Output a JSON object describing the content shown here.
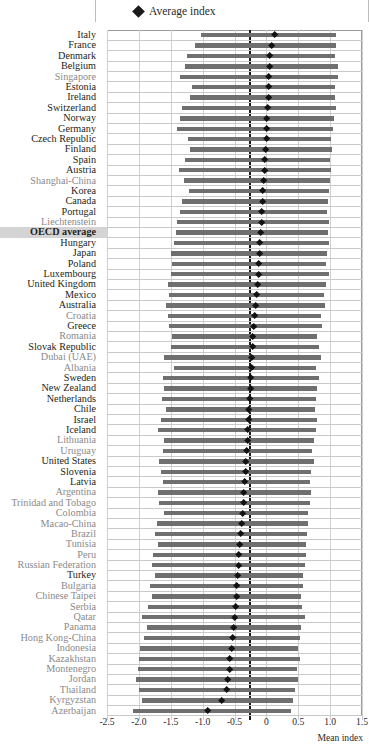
{
  "legend": {
    "marker_icon": "diamond-marker",
    "label": "Average index"
  },
  "axis": {
    "title": "Mean index",
    "ticks": [
      "-2.5",
      "-2.0",
      "-1.5",
      "-1.0",
      "-0.5",
      "0",
      "0.5",
      "1.0",
      "1.5"
    ],
    "tick_values": [
      -2.5,
      -2.0,
      -1.5,
      -1.0,
      -0.5,
      0,
      0.5,
      1.0,
      1.5
    ],
    "min": -2.5,
    "max": 1.5
  },
  "colors": {
    "bar": "#6f6f6f",
    "marker": "#111111",
    "grid": "#d0d0d0",
    "frame": "#9a9a9a",
    "reference_line": "#1a1a1a",
    "oecd_label": "#231f20",
    "partner_label": "#8a8a8a",
    "highlight_bg": "#d4d4d4"
  },
  "reference_line_value": -0.27,
  "chart_data": {
    "type": "bar",
    "title": "",
    "subtitle": "",
    "xlabel": "Mean index",
    "ylabel": "",
    "xlim": [
      -2.5,
      1.5
    ],
    "grid": true,
    "legend_position": "top",
    "series": [
      {
        "name": "Range (bottom quarter to top quarter)",
        "type": "range-bar"
      },
      {
        "name": "Average index",
        "type": "diamond-marker"
      }
    ],
    "categories": [
      "Italy",
      "France",
      "Denmark",
      "Belgium",
      "Singapore",
      "Estonia",
      "Ireland",
      "Switzerland",
      "Norway",
      "Germany",
      "Czech Republic",
      "Finland",
      "Spain",
      "Austria",
      "Shanghai-China",
      "Korea",
      "Canada",
      "Portugal",
      "Liechtenstein",
      "OECD average",
      "Hungary",
      "Japan",
      "Poland",
      "Luxembourg",
      "United Kingdom",
      "Mexico",
      "Australia",
      "Croatia",
      "Greece",
      "Romania",
      "Slovak Republic",
      "Dubai (UAE)",
      "Albania",
      "Sweden",
      "New Zealand",
      "Netherlands",
      "Chile",
      "Israel",
      "Iceland",
      "Lithuania",
      "Uruguay",
      "United States",
      "Slovenia",
      "Latvia",
      "Argentina",
      "Trinidad and Tobago",
      "Colombia",
      "Macao-China",
      "Brazil",
      "Tunisia",
      "Peru",
      "Russian Federation",
      "Turkey",
      "Bulgaria",
      "Chinese Taipei",
      "Serbia",
      "Qatar",
      "Panama",
      "Hong Kong-China",
      "Indonesia",
      "Kazakhstan",
      "Montenegro",
      "Jordan",
      "Thailand",
      "Kyrgyzstan",
      "Azerbaijan"
    ],
    "rows": [
      {
        "label": "Italy",
        "partner": false,
        "highlight": false,
        "low": -1.02,
        "high": 1.1,
        "avg": 0.13
      },
      {
        "label": "France",
        "partner": false,
        "highlight": false,
        "low": -1.12,
        "high": 1.1,
        "avg": 0.09
      },
      {
        "label": "Denmark",
        "partner": false,
        "highlight": false,
        "low": -1.25,
        "high": 1.08,
        "avg": 0.05
      },
      {
        "label": "Belgium",
        "partner": false,
        "highlight": false,
        "low": -1.28,
        "high": 1.12,
        "avg": 0.05
      },
      {
        "label": "Singapore",
        "partner": true,
        "highlight": false,
        "low": -1.35,
        "high": 1.12,
        "avg": 0.04
      },
      {
        "label": "Estonia",
        "partner": false,
        "highlight": false,
        "low": -1.16,
        "high": 1.07,
        "avg": 0.03
      },
      {
        "label": "Ireland",
        "partner": false,
        "highlight": false,
        "low": -1.2,
        "high": 1.08,
        "avg": 0.03
      },
      {
        "label": "Switzerland",
        "partner": false,
        "highlight": false,
        "low": -1.33,
        "high": 1.09,
        "avg": 0.02
      },
      {
        "label": "Norway",
        "partner": false,
        "highlight": false,
        "low": -1.35,
        "high": 1.06,
        "avg": 0.01
      },
      {
        "label": "Germany",
        "partner": false,
        "highlight": false,
        "low": -1.4,
        "high": 1.04,
        "avg": 0.0
      },
      {
        "label": "Czech Republic",
        "partner": false,
        "highlight": false,
        "low": -1.23,
        "high": 1.02,
        "avg": 0.0
      },
      {
        "label": "Finland",
        "partner": false,
        "highlight": false,
        "low": -1.2,
        "high": 1.03,
        "avg": -0.01
      },
      {
        "label": "Spain",
        "partner": false,
        "highlight": false,
        "low": -1.28,
        "high": 1.0,
        "avg": -0.02
      },
      {
        "label": "Austria",
        "partner": false,
        "highlight": false,
        "low": -1.37,
        "high": 1.02,
        "avg": -0.03
      },
      {
        "label": "Shanghai-China",
        "partner": true,
        "highlight": false,
        "low": -1.3,
        "high": 1.0,
        "avg": -0.04
      },
      {
        "label": "Korea",
        "partner": false,
        "highlight": false,
        "low": -1.22,
        "high": 0.98,
        "avg": -0.05
      },
      {
        "label": "Canada",
        "partner": false,
        "highlight": false,
        "low": -1.33,
        "high": 0.96,
        "avg": -0.06
      },
      {
        "label": "Portugal",
        "partner": false,
        "highlight": false,
        "low": -1.35,
        "high": 0.95,
        "avg": -0.07
      },
      {
        "label": "Liechtenstein",
        "partner": true,
        "highlight": false,
        "low": -1.4,
        "high": 0.98,
        "avg": -0.08
      },
      {
        "label": "OECD average",
        "partner": false,
        "highlight": true,
        "low": -1.42,
        "high": 0.96,
        "avg": -0.09
      },
      {
        "label": "Hungary",
        "partner": false,
        "highlight": false,
        "low": -1.45,
        "high": 0.98,
        "avg": -0.1
      },
      {
        "label": "Japan",
        "partner": false,
        "highlight": false,
        "low": -1.5,
        "high": 0.95,
        "avg": -0.11
      },
      {
        "label": "Poland",
        "partner": false,
        "highlight": false,
        "low": -1.48,
        "high": 0.93,
        "avg": -0.12
      },
      {
        "label": "Luxembourg",
        "partner": false,
        "highlight": false,
        "low": -1.5,
        "high": 0.99,
        "avg": -0.12
      },
      {
        "label": "United Kingdom",
        "partner": false,
        "highlight": false,
        "low": -1.55,
        "high": 0.93,
        "avg": -0.14
      },
      {
        "label": "Mexico",
        "partner": false,
        "highlight": false,
        "low": -1.53,
        "high": 0.9,
        "avg": -0.15
      },
      {
        "label": "Australia",
        "partner": false,
        "highlight": false,
        "low": -1.58,
        "high": 0.92,
        "avg": -0.17
      },
      {
        "label": "Croatia",
        "partner": true,
        "highlight": false,
        "low": -1.55,
        "high": 0.85,
        "avg": -0.19
      },
      {
        "label": "Greece",
        "partner": false,
        "highlight": false,
        "low": -1.53,
        "high": 0.88,
        "avg": -0.2
      },
      {
        "label": "Romania",
        "partner": true,
        "highlight": false,
        "low": -1.48,
        "high": 0.8,
        "avg": -0.21
      },
      {
        "label": "Slovak Republic",
        "partner": false,
        "highlight": false,
        "low": -1.5,
        "high": 0.82,
        "avg": -0.22
      },
      {
        "label": "Dubai (UAE)",
        "partner": true,
        "highlight": false,
        "low": -1.6,
        "high": 0.85,
        "avg": -0.23
      },
      {
        "label": "Albania",
        "partner": true,
        "highlight": false,
        "low": -1.45,
        "high": 0.78,
        "avg": -0.23
      },
      {
        "label": "Sweden",
        "partner": false,
        "highlight": false,
        "low": -1.62,
        "high": 0.82,
        "avg": -0.24
      },
      {
        "label": "New Zealand",
        "partner": false,
        "highlight": false,
        "low": -1.6,
        "high": 0.8,
        "avg": -0.25
      },
      {
        "label": "Netherlands",
        "partner": false,
        "highlight": false,
        "low": -1.63,
        "high": 0.78,
        "avg": -0.26
      },
      {
        "label": "Chile",
        "partner": false,
        "highlight": false,
        "low": -1.58,
        "high": 0.76,
        "avg": -0.27
      },
      {
        "label": "Israel",
        "partner": false,
        "highlight": false,
        "low": -1.65,
        "high": 0.8,
        "avg": -0.28
      },
      {
        "label": "Iceland",
        "partner": false,
        "highlight": false,
        "low": -1.7,
        "high": 0.78,
        "avg": -0.29
      },
      {
        "label": "Lithuania",
        "partner": true,
        "highlight": false,
        "low": -1.6,
        "high": 0.74,
        "avg": -0.3
      },
      {
        "label": "Uruguay",
        "partner": true,
        "highlight": false,
        "low": -1.62,
        "high": 0.72,
        "avg": -0.31
      },
      {
        "label": "United States",
        "partner": false,
        "highlight": false,
        "low": -1.68,
        "high": 0.74,
        "avg": -0.32
      },
      {
        "label": "Slovenia",
        "partner": false,
        "highlight": false,
        "low": -1.65,
        "high": 0.7,
        "avg": -0.33
      },
      {
        "label": "Latvia",
        "partner": false,
        "highlight": false,
        "low": -1.62,
        "high": 0.68,
        "avg": -0.34
      },
      {
        "label": "Argentina",
        "partner": true,
        "highlight": false,
        "low": -1.7,
        "high": 0.7,
        "avg": -0.35
      },
      {
        "label": "Trinidad and Tobago",
        "partner": true,
        "highlight": false,
        "low": -1.68,
        "high": 0.68,
        "avg": -0.36
      },
      {
        "label": "Colombia",
        "partner": true,
        "highlight": false,
        "low": -1.6,
        "high": 0.65,
        "avg": -0.37
      },
      {
        "label": "Macao-China",
        "partner": true,
        "highlight": false,
        "low": -1.72,
        "high": 0.66,
        "avg": -0.38
      },
      {
        "label": "Brazil",
        "partner": true,
        "highlight": false,
        "low": -1.75,
        "high": 0.64,
        "avg": -0.41
      },
      {
        "label": "Tunisia",
        "partner": true,
        "highlight": false,
        "low": -1.7,
        "high": 0.62,
        "avg": -0.42
      },
      {
        "label": "Peru",
        "partner": true,
        "highlight": false,
        "low": -1.78,
        "high": 0.62,
        "avg": -0.43
      },
      {
        "label": "Russian Federation",
        "partner": true,
        "highlight": false,
        "low": -1.8,
        "high": 0.6,
        "avg": -0.44
      },
      {
        "label": "Turkey",
        "partner": false,
        "highlight": false,
        "low": -1.75,
        "high": 0.58,
        "avg": -0.45
      },
      {
        "label": "Bulgaria",
        "partner": true,
        "highlight": false,
        "low": -1.82,
        "high": 0.58,
        "avg": -0.46
      },
      {
        "label": "Chinese Taipei",
        "partner": true,
        "highlight": false,
        "low": -1.8,
        "high": 0.55,
        "avg": -0.47
      },
      {
        "label": "Serbia",
        "partner": true,
        "highlight": false,
        "low": -1.85,
        "high": 0.56,
        "avg": -0.48
      },
      {
        "label": "Qatar",
        "partner": true,
        "highlight": false,
        "low": -1.95,
        "high": 0.6,
        "avg": -0.5
      },
      {
        "label": "Panama",
        "partner": true,
        "highlight": false,
        "low": -1.88,
        "high": 0.55,
        "avg": -0.51
      },
      {
        "label": "Hong Kong-China",
        "partner": true,
        "highlight": false,
        "low": -1.92,
        "high": 0.52,
        "avg": -0.53
      },
      {
        "label": "Indonesia",
        "partner": true,
        "highlight": false,
        "low": -1.98,
        "high": 0.5,
        "avg": -0.55
      },
      {
        "label": "Kazakhstan",
        "partner": true,
        "highlight": false,
        "low": -2.0,
        "high": 0.52,
        "avg": -0.57
      },
      {
        "label": "Montenegro",
        "partner": true,
        "highlight": false,
        "low": -2.02,
        "high": 0.48,
        "avg": -0.58
      },
      {
        "label": "Jordan",
        "partner": true,
        "highlight": false,
        "low": -2.05,
        "high": 0.5,
        "avg": -0.6
      },
      {
        "label": "Thailand",
        "partner": true,
        "highlight": false,
        "low": -2.0,
        "high": 0.45,
        "avg": -0.62
      },
      {
        "label": "Kyrgyzstan",
        "partner": true,
        "highlight": false,
        "low": -1.95,
        "high": 0.42,
        "avg": -0.7
      },
      {
        "label": "Azerbaijan",
        "partner": true,
        "highlight": false,
        "low": -2.1,
        "high": 0.38,
        "avg": -0.92
      }
    ]
  }
}
